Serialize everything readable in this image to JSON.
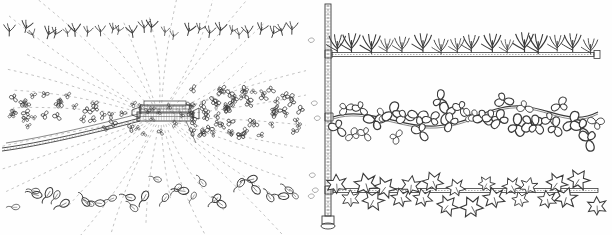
{
  "figure": {
    "title": "",
    "panels": [
      {
        "id": "left",
        "name": "radial-dispersal-diagram",
        "description": "Plan view of a track-mounted machine at centre with dashed radial spray lines fanning outward and scattered plant symbols in three horizontal bands",
        "center_object": {
          "name": "track-mounted-machine",
          "label": "",
          "x": 160,
          "y": 117
        },
        "track": {
          "name": "curved-double-rail-track",
          "label": ""
        },
        "bands": [
          {
            "name": "upper-band-grass-symbols",
            "symbol": "grass-tuft",
            "count": 27,
            "y": 36
          },
          {
            "name": "middle-band-clover-symbols",
            "symbol": "clover-leaf",
            "count": 95,
            "y": 112
          },
          {
            "name": "lower-band-leaf-symbols",
            "symbol": "ivy-leaf",
            "count": 28,
            "y": 192
          }
        ],
        "radial_lines": {
          "name": "dashed-radial-spray-lines",
          "count": 34,
          "style": "dashed"
        }
      },
      {
        "id": "right",
        "name": "three-tier-plant-post-diagram",
        "description": "Vertical post with base, carrying three horizontal arms; each arm bears a different foliage type",
        "post": {
          "name": "vertical-post",
          "label": "",
          "base_label": ""
        },
        "arms": [
          {
            "name": "arm-top-grass",
            "label": "",
            "foliage": "grass-blades",
            "y": 56,
            "count": 16
          },
          {
            "name": "arm-middle-clover",
            "label": "",
            "foliage": "clover-rosettes",
            "y": 118,
            "count": 34
          },
          {
            "name": "arm-bottom-ivy",
            "label": "",
            "foliage": "ivy-stars",
            "y": 192,
            "count": 22
          }
        ]
      }
    ],
    "colors": {
      "ink": "#3a3a3a",
      "ink_light": "#8d8d8d",
      "background": "#fefefe"
    }
  }
}
